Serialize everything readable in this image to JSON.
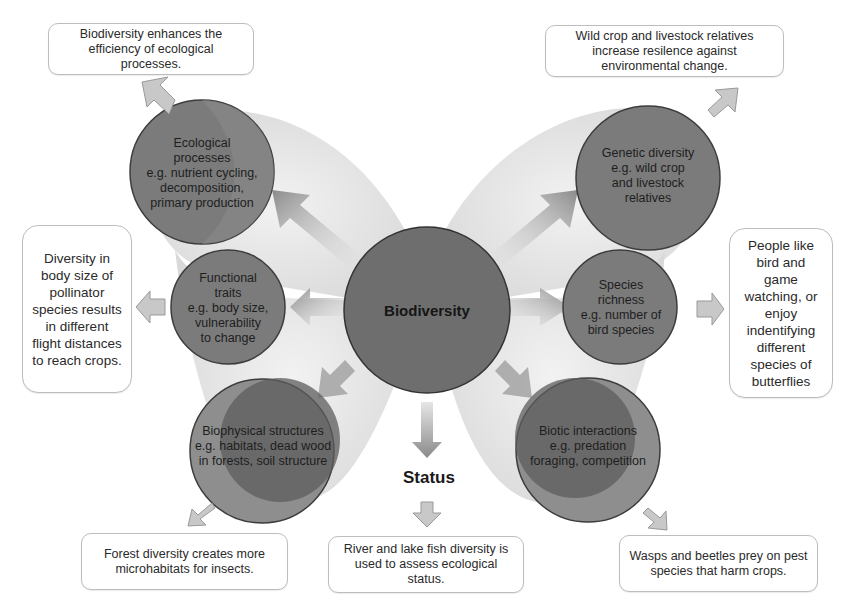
{
  "center": {
    "label": "Biodiversity"
  },
  "status": {
    "label": "Status"
  },
  "components": [
    {
      "id": "ecological-processes",
      "title": "Ecological processes",
      "lines": [
        "Ecological",
        "processes",
        "e.g. nutrient cycling,",
        "decomposition,",
        "primary production"
      ]
    },
    {
      "id": "functional-traits",
      "title": "Functional traits",
      "lines": [
        "Functional",
        "traits",
        "e.g. body size,",
        "vulnerability",
        "to change"
      ]
    },
    {
      "id": "biophysical-structures",
      "title": "Biophysical structures",
      "lines": [
        "Biophysical structures",
        "e.g. habitats, dead wood",
        "in forests, soil structure"
      ]
    },
    {
      "id": "genetic-diversity",
      "title": "Genetic diversity",
      "lines": [
        "Genetic diversity",
        "e.g. wild crop",
        "and livestock",
        "relatives"
      ]
    },
    {
      "id": "species-richness",
      "title": "Species richness",
      "lines": [
        "Species",
        "richness",
        "e.g. number of",
        "bird species"
      ]
    },
    {
      "id": "biotic-interactions",
      "title": "Biotic interactions",
      "lines": [
        "Biotic interactions",
        "e.g. predation",
        "foraging, competition"
      ]
    }
  ],
  "examples": {
    "ecological_processes": "Biodiversity enhances the efficiency of ecological processes.",
    "functional_traits": "Diversity in body size of pollinator species results in different flight distances to reach crops.",
    "biophysical_structures": "Forest diversity creates more microhabitats for insects.",
    "status": "River and lake fish diversity is used to assess ecological status.",
    "genetic_diversity": "Wild crop and livestock relatives increase resilence against environmental change.",
    "species_richness": "People like bird and game watching, or enjoy indentifying different species of butterflies",
    "biotic_interactions": "Wasps and beetles prey on pest species that harm crops."
  },
  "colors": {
    "circle_fill": "#7d7d7d",
    "circle_stroke": "#3c3c3c",
    "wing_fill": "#e4e4e4",
    "arrow_fill": "#b8b8b8",
    "box_border": "#bdbdbd"
  }
}
